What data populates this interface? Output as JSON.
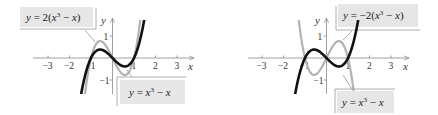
{
  "chart_data": [
    {
      "type": "line",
      "title": "",
      "xlabel": "x",
      "ylabel": "y",
      "xlim": [
        -3.5,
        3.7
      ],
      "ylim": [
        -1.6,
        1.7
      ],
      "x_ticks": [
        -3,
        -2,
        -1,
        1,
        2,
        3
      ],
      "x_tick_labels": [
        "−3",
        "−2",
        "−1",
        "1",
        "2",
        "3"
      ],
      "y_ticks": [
        1,
        -1
      ],
      "y_tick_labels": [
        "1",
        "−1"
      ],
      "grid": false,
      "series": [
        {
          "name": "y = 2(x³ − x)",
          "formula": "2*(x^3 - x)",
          "color": "#b3b3b3",
          "width": 2.2,
          "x_range": [
            -1.32,
            1.32
          ]
        },
        {
          "name": "y = x³ − x",
          "formula": "x^3 - x",
          "color": "#111111",
          "width": 2.6,
          "x_range": [
            -1.55,
            1.55
          ]
        }
      ],
      "annotations": [
        {
          "text_parts": [
            "y",
            " = 2(",
            "x",
            "3",
            " − ",
            "x",
            ")"
          ],
          "position": "top-left"
        },
        {
          "text_parts": [
            "y",
            " = ",
            "x",
            "3",
            " − ",
            "x"
          ],
          "position": "bottom-right"
        }
      ]
    },
    {
      "type": "line",
      "title": "",
      "xlabel": "x",
      "ylabel": "y",
      "xlim": [
        -3.5,
        3.7
      ],
      "ylim": [
        -1.6,
        1.7
      ],
      "x_ticks": [
        -3,
        -2,
        -1,
        1,
        2,
        3
      ],
      "x_tick_labels": [
        "−3",
        "−2",
        "−1",
        "1",
        "2",
        "3"
      ],
      "y_ticks": [
        1,
        -1
      ],
      "y_tick_labels": [
        "1",
        "−1"
      ],
      "grid": false,
      "series": [
        {
          "name": "y = −2(x³ − x)",
          "formula": "-2*(x^3 - x)",
          "color": "#b3b3b3",
          "width": 2.2,
          "x_range": [
            -1.32,
            1.32
          ]
        },
        {
          "name": "y = x³ − x",
          "formula": "x^3 - x",
          "color": "#111111",
          "width": 2.6,
          "x_range": [
            -1.55,
            1.55
          ]
        }
      ],
      "annotations": [
        {
          "text_parts": [
            "y",
            " = −2(",
            "x",
            "3",
            " − ",
            "x",
            ")"
          ],
          "position": "top-right"
        },
        {
          "text_parts": [
            "y",
            " = ",
            "x",
            "3",
            " − ",
            "x"
          ],
          "position": "bottom-right"
        }
      ]
    }
  ],
  "left": {
    "top_label": {
      "y": "y",
      "eq": " = 2(",
      "x": "x",
      "exp": "3",
      "minus": " − ",
      "x2": "x",
      "close": ")"
    },
    "bottom_label": {
      "y": "y",
      "eq": " = ",
      "x": "x",
      "exp": "3",
      "minus": " − ",
      "x2": "x"
    },
    "axis_x": "x",
    "axis_y": "y",
    "ticks_x": [
      "−3",
      "−2",
      "−1",
      "1",
      "2",
      "3"
    ],
    "ticks_y": [
      "1",
      "−1"
    ]
  },
  "right": {
    "top_label": {
      "y": "y",
      "eq": " = −2(",
      "x": "x",
      "exp": "3",
      "minus": " − ",
      "x2": "x",
      "close": ")"
    },
    "bottom_label": {
      "y": "y",
      "eq": " = ",
      "x": "x",
      "exp": "3",
      "minus": " − ",
      "x2": "x"
    },
    "axis_x": "x",
    "axis_y": "y",
    "ticks_x": [
      "−3",
      "−2",
      "−1",
      "1",
      "2",
      "3"
    ],
    "ticks_y": [
      "1",
      "−1"
    ]
  },
  "colors": {
    "axis": "#888888",
    "label_box": "#e6e6e6",
    "label_border": "#9a9a9a",
    "gray_curve": "#b3b3b3",
    "black_curve": "#111111"
  }
}
